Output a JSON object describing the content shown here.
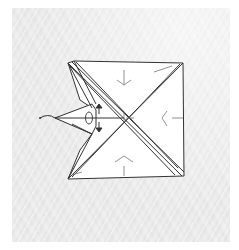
{
  "figure": {
    "type": "origami-step-diagram",
    "background_color": "#e0e0e0",
    "paper_color": "#ffffff",
    "line_color": "#333333",
    "annotations": {
      "arrows": [
        "push-up-arrow",
        "push-down-arrow"
      ],
      "valley_fold_marks": 4,
      "pivot_loop": "fold-flap-loop-arrow"
    }
  }
}
